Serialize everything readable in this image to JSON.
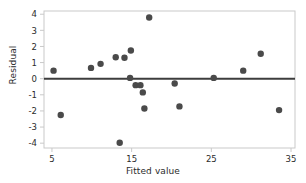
{
  "chart_data": {
    "type": "scatter",
    "title": "",
    "xlabel": "Fitted value",
    "ylabel": "Residual",
    "xlim": [
      4.0,
      35.5
    ],
    "ylim": [
      -4.3,
      4.2
    ],
    "xticks": [
      5,
      15,
      25,
      35
    ],
    "yticks": [
      4,
      3,
      2,
      1,
      0,
      -1,
      -2,
      -3,
      -4
    ],
    "xticklabels": [
      "5",
      "15",
      "25",
      "35"
    ],
    "yticklabels": [
      "4",
      "3",
      "2",
      "1",
      "0",
      "-1",
      "-2",
      "-3",
      "-4"
    ],
    "grid": false,
    "legend": null,
    "reference_line": {
      "type": "horizontal",
      "y": 0,
      "color": "#3d3d3d"
    },
    "marker": {
      "shape": "circle",
      "color": "#4a4a4a",
      "size": 3.2
    },
    "points": [
      {
        "x": 5.2,
        "y": 0.5
      },
      {
        "x": 6.1,
        "y": -2.25
      },
      {
        "x": 9.9,
        "y": 0.67
      },
      {
        "x": 11.1,
        "y": 0.92
      },
      {
        "x": 13.0,
        "y": 1.33
      },
      {
        "x": 14.1,
        "y": 1.3
      },
      {
        "x": 13.5,
        "y": -3.97
      },
      {
        "x": 14.9,
        "y": 1.75
      },
      {
        "x": 14.8,
        "y": 0.05
      },
      {
        "x": 15.5,
        "y": -0.4
      },
      {
        "x": 16.1,
        "y": -0.4
      },
      {
        "x": 16.4,
        "y": -0.85
      },
      {
        "x": 16.6,
        "y": -1.85
      },
      {
        "x": 17.2,
        "y": 3.8
      },
      {
        "x": 20.4,
        "y": -0.3
      },
      {
        "x": 21.0,
        "y": -1.72
      },
      {
        "x": 25.3,
        "y": 0.05
      },
      {
        "x": 29.0,
        "y": 0.5
      },
      {
        "x": 31.2,
        "y": 1.55
      },
      {
        "x": 33.5,
        "y": -1.95
      }
    ]
  },
  "axes": {
    "x_title": "Fitted value",
    "y_title": "Residual"
  },
  "colors": {
    "marker": "#4a4a4a",
    "frame": "#c9c9c9",
    "zero_line": "#3d3d3d",
    "text": "#2b2b2b",
    "background": "#ffffff"
  }
}
